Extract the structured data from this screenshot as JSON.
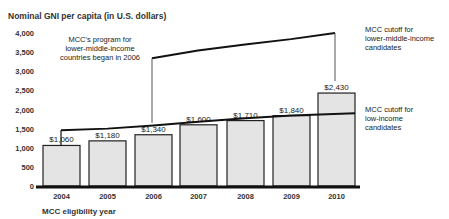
{
  "chart_data": {
    "type": "bar",
    "title": "",
    "ylabel": "Nominal GNI per capita (in U.S. dollars)",
    "xlabel": "MCC eligibility year",
    "ylim": [
      0,
      4000
    ],
    "yticks": [
      0,
      500,
      1000,
      1500,
      2000,
      2500,
      3000,
      3500,
      4000
    ],
    "ytick_labels": [
      "0",
      "500",
      "1,000",
      "1,500",
      "2,000",
      "2,500",
      "3,000",
      "3,500",
      "4,000"
    ],
    "categories": [
      "2004",
      "2005",
      "2006",
      "2007",
      "2008",
      "2009",
      "2010"
    ],
    "values": [
      1060,
      1180,
      1340,
      1600,
      1710,
      1840,
      2430
    ],
    "bar_labels": [
      "$1,060",
      "$1,180",
      "$1,340",
      "$1,600",
      "$1,710",
      "$1,840",
      "$2,430"
    ],
    "series": [
      {
        "name": "MCC cutoff for low-income candidates",
        "type": "line",
        "x": [
          "2004",
          "2005",
          "2006",
          "2007",
          "2008",
          "2009",
          "2010"
        ],
        "values": [
          1460,
          1500,
          1580,
          1680,
          1770,
          1840,
          1900
        ]
      },
      {
        "name": "MCC cutoff for lower-middle-income candidates",
        "type": "line",
        "x": [
          "2006",
          "2007",
          "2008",
          "2009",
          "2010"
        ],
        "values": [
          3340,
          3540,
          3700,
          3840,
          4000
        ]
      }
    ],
    "annotations": [
      "MCC's program for lower-middle-income countries began in 2006",
      "MCC cutoff for lower-middle-income candidates",
      "MCC cutoff for low-income candidates"
    ],
    "grid": false,
    "legend": "none (inline right-side labels)"
  },
  "labels": {
    "y_title": "Nominal GNI per capita (in U.S. dollars)",
    "x_title": "MCC eligibility year",
    "note_lines": [
      "MCC's program for",
      "lower-middle-income",
      "countries began in 2006"
    ],
    "upper_label_lines": [
      "MCC cutoff for",
      "lower-middle-income",
      "candidates"
    ],
    "lower_label_lines": [
      "MCC cutoff for",
      "low-income",
      "candidates"
    ]
  },
  "colors": {
    "bar_fill": "#e4e4e4",
    "bar_stroke": "#222222",
    "line": "#111111",
    "axis": "#111111"
  }
}
